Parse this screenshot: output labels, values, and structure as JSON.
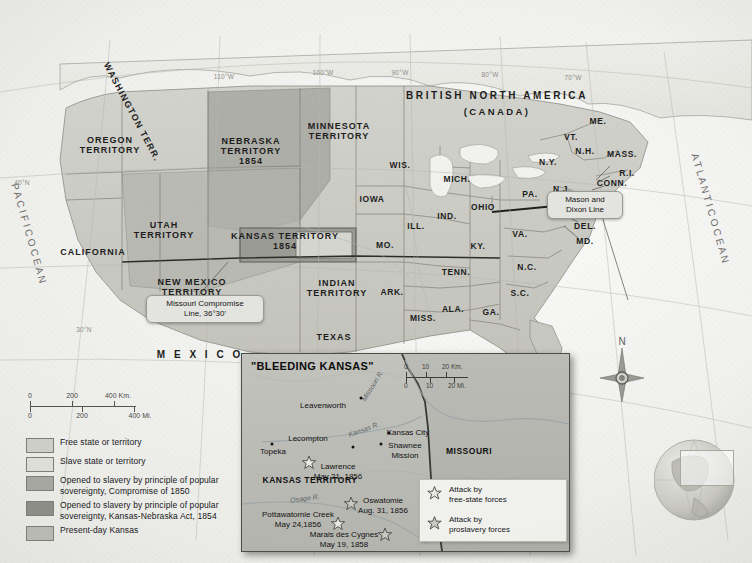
{
  "map": {
    "title_lines": [
      "BRITISH NORTH AMERICA",
      "(CANADA)"
    ],
    "oceans": {
      "pacific": "P A C I F I C   O C E A N",
      "atlantic": "A T L A N T I C   O C E A N"
    },
    "mexico": "M E X I C O",
    "grid_labels": [
      {
        "text": "110°W",
        "x": 224,
        "y": 76
      },
      {
        "text": "100°W",
        "x": 323,
        "y": 72
      },
      {
        "text": "90°W",
        "x": 400,
        "y": 72
      },
      {
        "text": "80°W",
        "x": 490,
        "y": 74
      },
      {
        "text": "70°W",
        "x": 573,
        "y": 77
      },
      {
        "text": "40°N",
        "x": 22,
        "y": 182
      },
      {
        "text": "30°N",
        "x": 84,
        "y": 329
      }
    ],
    "territories": [
      {
        "name": "WASHINGTON TERR.",
        "x": 132,
        "y": 112,
        "rot": true
      },
      {
        "name": "OREGON\nTERRITORY",
        "x": 110,
        "y": 145
      },
      {
        "name": "UTAH\nTERRITORY",
        "x": 164,
        "y": 230
      },
      {
        "name": "CALIFORNIA",
        "x": 93,
        "y": 252
      },
      {
        "name": "NEW MEXICO\nTERRITORY",
        "x": 192,
        "y": 287
      },
      {
        "name": "NEBRASKA\nTERRITORY\n1854",
        "x": 251,
        "y": 151
      },
      {
        "name": "MINNESOTA\nTERRITORY",
        "x": 339,
        "y": 131
      },
      {
        "name": "KANSAS TERRITORY\n1854",
        "x": 285,
        "y": 241
      },
      {
        "name": "INDIAN\nTERRITORY",
        "x": 337,
        "y": 288
      },
      {
        "name": "TEXAS",
        "x": 334,
        "y": 337
      }
    ],
    "states": [
      {
        "name": "WIS.",
        "x": 400,
        "y": 166
      },
      {
        "name": "IOWA",
        "x": 372,
        "y": 200
      },
      {
        "name": "MICH.",
        "x": 457,
        "y": 180
      },
      {
        "name": "ILL.",
        "x": 416,
        "y": 227
      },
      {
        "name": "IND.",
        "x": 447,
        "y": 217
      },
      {
        "name": "OHIO",
        "x": 483,
        "y": 208
      },
      {
        "name": "MO.",
        "x": 385,
        "y": 246
      },
      {
        "name": "KY.",
        "x": 478,
        "y": 247
      },
      {
        "name": "TENN.",
        "x": 456,
        "y": 273
      },
      {
        "name": "ARK.",
        "x": 392,
        "y": 293
      },
      {
        "name": "MISS.",
        "x": 423,
        "y": 319
      },
      {
        "name": "ALA.",
        "x": 453,
        "y": 310
      },
      {
        "name": "GA.",
        "x": 491,
        "y": 313
      },
      {
        "name": "FLA.",
        "x": 548,
        "y": 364
      },
      {
        "name": "S.C.",
        "x": 520,
        "y": 294
      },
      {
        "name": "N.C.",
        "x": 527,
        "y": 268
      },
      {
        "name": "VA.",
        "x": 520,
        "y": 235
      },
      {
        "name": "PA.",
        "x": 530,
        "y": 195
      },
      {
        "name": "N.Y.",
        "x": 548,
        "y": 163
      },
      {
        "name": "VT.",
        "x": 571,
        "y": 138
      },
      {
        "name": "N.H.",
        "x": 585,
        "y": 152
      },
      {
        "name": "ME.",
        "x": 598,
        "y": 122
      },
      {
        "name": "MASS.",
        "x": 622,
        "y": 155
      },
      {
        "name": "R.I.",
        "x": 627,
        "y": 174
      },
      {
        "name": "CONN.",
        "x": 612,
        "y": 184
      },
      {
        "name": "N.J.",
        "x": 562,
        "y": 190
      },
      {
        "name": "DEL.",
        "x": 585,
        "y": 227
      },
      {
        "name": "MD.",
        "x": 585,
        "y": 242
      }
    ],
    "callouts": [
      {
        "id": "mason-dixon",
        "text": "Mason and\nDixon Line",
        "x": 578,
        "y": 195,
        "w": 62
      },
      {
        "id": "missouri-compromise",
        "text": "Missouri Compromise\nLine, 36°30'",
        "x": 198,
        "y": 303,
        "w": 104
      }
    ],
    "scale": {
      "km": {
        "labels": [
          "0",
          "200",
          "400 Km."
        ],
        "positions": [
          0,
          40,
          80
        ]
      },
      "mi": {
        "labels": [
          "0",
          "200",
          "400 Mi."
        ],
        "positions": [
          0,
          50,
          100
        ]
      }
    },
    "compass_north": "N"
  },
  "legend": {
    "items": [
      {
        "label": "Free state or territory",
        "color": "#cfcfc9"
      },
      {
        "label": "Slave state or territory",
        "color": "#e0e0da"
      },
      {
        "label": "Opened to slavery by principle of popular\nsovereignty, Compromise of 1850",
        "color": "#a8a8a2"
      },
      {
        "label": "Opened to slavery by principle of popular\nsovereignty, Kansas-Nebraska Act, 1854",
        "color": "#8e8e89"
      },
      {
        "label": "Present-day Kansas",
        "color": "#bdbdb7"
      }
    ]
  },
  "inset": {
    "title": "\"BLEEDING KANSAS\"",
    "region_labels": [
      {
        "name": "KANSAS TERRITORY",
        "x": 68,
        "y": 126
      },
      {
        "name": "MISSOURI",
        "x": 227,
        "y": 97
      }
    ],
    "rivers": [
      {
        "name": "Missouri R.",
        "x": 131,
        "y": 32,
        "rot": -58
      },
      {
        "name": "Kansas R.",
        "x": 122,
        "y": 76,
        "rot": -20
      },
      {
        "name": "Osage R.",
        "x": 63,
        "y": 145,
        "rot": -8
      }
    ],
    "cities": [
      {
        "name": "Leavenworth",
        "x": 81,
        "y": 52,
        "dx": 119,
        "dy": 44
      },
      {
        "name": "Lecompton",
        "x": 66,
        "y": 85,
        "dx": 111,
        "dy": 93
      },
      {
        "name": "Topeka",
        "x": 31,
        "y": 98,
        "dx": 30,
        "dy": 90
      },
      {
        "name": "Kansas City",
        "x": 166,
        "y": 79,
        "dx": 147,
        "dy": 79
      },
      {
        "name": "Shawnee\nMission",
        "x": 163,
        "y": 97,
        "dx": 139,
        "dy": 90
      }
    ],
    "events": [
      {
        "name": "Lawrence\nMay 21, 1856",
        "lx": 96,
        "ly": 118,
        "sx": 67,
        "sy": 111,
        "force": "free-state"
      },
      {
        "name": "Oswatomie\nAug. 31, 1856",
        "lx": 141,
        "ly": 152,
        "sx": 109,
        "sy": 152,
        "force": "proslavery"
      },
      {
        "name": "Pottawatomie Creek\nMay 24,1856",
        "lx": 56,
        "ly": 166,
        "sx": 96,
        "sy": 172,
        "force": "free-state"
      },
      {
        "name": "Marais des Cygnes\nMay 19, 1858",
        "lx": 102,
        "ly": 186,
        "sx": 143,
        "sy": 183,
        "force": "proslavery"
      }
    ],
    "legend": [
      {
        "label": "Attack by\nfree-state forces",
        "force": "free-state"
      },
      {
        "label": "Attack by\nproslavery forces",
        "force": "proslavery"
      }
    ],
    "scale": {
      "km": {
        "labels": [
          "0",
          "10",
          "20 Km."
        ]
      },
      "mi": {
        "labels": [
          "0",
          "10",
          "20 Mi."
        ]
      }
    }
  }
}
